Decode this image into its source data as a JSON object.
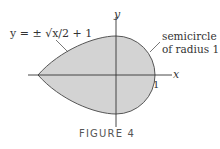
{
  "figure": {
    "caption": "FIGURE 4",
    "equation_label": "y = ± √x/2 + 1",
    "semicircle_label_line1": "semicircle",
    "semicircle_label_line2": "of radius 1",
    "x_axis_label": "x",
    "y_axis_label": "y",
    "tick_label_1": "1",
    "colors": {
      "fill": "#d3d3d3",
      "stroke": "#555555",
      "axis": "#333333"
    }
  }
}
